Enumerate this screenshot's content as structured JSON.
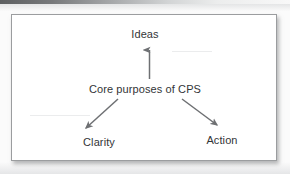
{
  "figure": {
    "type": "radial-concept-diagram",
    "background_color": "#fbfbfb",
    "panel_color": "#ffffff",
    "border_color": "#9b9d9f",
    "text_color": "#333537",
    "arrow_color": "#6e7073",
    "center_label": "Core purposes of CPS",
    "nodes": [
      {
        "id": "ideas",
        "label": "Ideas",
        "position": "top"
      },
      {
        "id": "clarity",
        "label": "Clarity",
        "position": "bottom-left"
      },
      {
        "id": "action",
        "label": "Action",
        "position": "bottom-right"
      }
    ],
    "arrows": [
      {
        "from": "center",
        "to": "ideas",
        "direction": "up",
        "head": "arrow"
      },
      {
        "from": "center",
        "to": "clarity",
        "direction": "down-left",
        "head": "arrow"
      },
      {
        "from": "center",
        "to": "action",
        "direction": "down-right",
        "head": "arrow"
      }
    ]
  }
}
